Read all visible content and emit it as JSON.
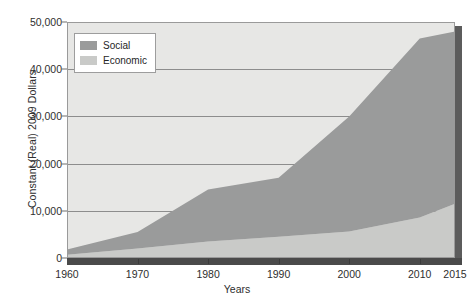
{
  "chart_data": {
    "type": "area",
    "stacked": true,
    "title": "",
    "xlabel": "Years",
    "ylabel": "Constant (Real) 2009 Dollars",
    "x": [
      1960,
      1970,
      1980,
      1990,
      2000,
      2010,
      2015
    ],
    "xlim": [
      1960,
      2015
    ],
    "ylim": [
      0,
      50000
    ],
    "xticks": [
      "1960",
      "1970",
      "1980",
      "1990",
      "2000",
      "2010",
      "2015"
    ],
    "yticks": [
      "0",
      "10,000",
      "20,000",
      "30,000",
      "40,000",
      "50,000"
    ],
    "ytick_values": [
      0,
      10000,
      20000,
      30000,
      40000,
      50000
    ],
    "grid": true,
    "legend_position": "top-left",
    "series": [
      {
        "name": "Economic",
        "color": "#c9cac8",
        "values": [
          700,
          2000,
          3500,
          4500,
          5600,
          8600,
          11500
        ]
      },
      {
        "name": "Social",
        "color": "#9a9b9b",
        "values": [
          1100,
          3500,
          11000,
          12500,
          24400,
          37900,
          36500
        ]
      }
    ],
    "totals": [
      1800,
      5500,
      14500,
      17000,
      30000,
      46500,
      48000
    ]
  },
  "legend": {
    "items": [
      {
        "label": "Social",
        "color": "#9a9b9b"
      },
      {
        "label": "Economic",
        "color": "#c9cac8"
      }
    ]
  },
  "colors": {
    "plot_background": "#e7e7e5",
    "gridline": "#8d8d8d",
    "frame": "#9a9a9a",
    "shadow": "#4a4a4a",
    "social": "#9a9b9b",
    "economic": "#c9cac8",
    "text": "#2e2e2e"
  }
}
